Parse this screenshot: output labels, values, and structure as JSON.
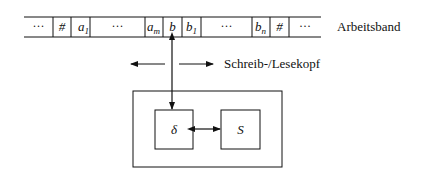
{
  "diagram": {
    "type": "turing-machine",
    "tape": {
      "label": "Arbeitsband",
      "cells": [
        {
          "text": "···",
          "kind": "dots"
        },
        {
          "text": "#",
          "kind": "symbol"
        },
        {
          "text": "a",
          "sub": "1",
          "kind": "symbol"
        },
        {
          "text": "···",
          "kind": "dots"
        },
        {
          "text": "a",
          "sub": "m",
          "kind": "symbol"
        },
        {
          "text": "b",
          "kind": "symbol"
        },
        {
          "text": "b",
          "sub": "1",
          "kind": "symbol"
        },
        {
          "text": "···",
          "kind": "dots"
        },
        {
          "text": "b",
          "sub": "n",
          "kind": "symbol"
        },
        {
          "text": "#",
          "kind": "symbol"
        },
        {
          "text": "···",
          "kind": "dots"
        }
      ]
    },
    "head": {
      "label": "Schreib-/Lesekopf",
      "directions": [
        "left",
        "right"
      ]
    },
    "control": {
      "transition_label": "δ",
      "state_label": "S",
      "connection": "bidirectional"
    }
  }
}
